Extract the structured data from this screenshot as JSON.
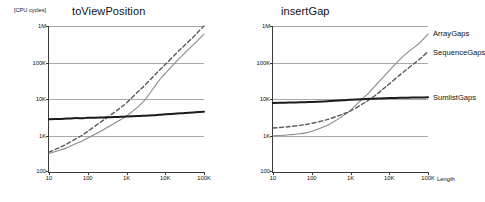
{
  "figure": {
    "unit_label": "[CPU cycles]",
    "xaxis_caption": "Length",
    "series_colors": {
      "ArrayGaps": "#8a8a8a",
      "SequenceGaps": "#5a5a5a",
      "SumlistGaps": "#1a1a1a"
    },
    "axis_color": "#3a3a3a",
    "grid_color": "#a8a8a8",
    "background": "#ffffff"
  },
  "legend": {
    "position": "right",
    "entries": [
      {
        "label": "ArrayGaps"
      },
      {
        "label": "SequenceGaps"
      },
      {
        "label": "SumlistGaps"
      }
    ]
  },
  "chart_data": [
    {
      "id": "toViewPosition",
      "type": "line",
      "title": "toViewPosition",
      "xlabel": "Length",
      "ylabel": "[CPU cycles]",
      "xscale": "log",
      "yscale": "log",
      "xlim": [
        10,
        100000
      ],
      "ylim": [
        100,
        1000000
      ],
      "grid": true,
      "xticks": [
        10,
        100,
        1000,
        10000,
        100000
      ],
      "xticklabels": [
        "10",
        "100",
        "1K",
        "10K",
        "100K"
      ],
      "yticks": [
        100,
        1000,
        10000,
        100000,
        1000000
      ],
      "yticklabels": [
        "100",
        "1K",
        "10K",
        "100K",
        "1M"
      ],
      "x": [
        10,
        20,
        30,
        50,
        70,
        100,
        200,
        300,
        500,
        700,
        1000,
        2000,
        3000,
        5000,
        7000,
        10000,
        20000,
        30000,
        50000,
        70000,
        100000
      ],
      "series": [
        {
          "name": "ArrayGaps",
          "style": "solid-thin",
          "values": [
            320,
            400,
            470,
            600,
            700,
            850,
            1250,
            1600,
            2200,
            2700,
            3400,
            6200,
            9500,
            20000,
            33000,
            50000,
            110000,
            170000,
            290000,
            410000,
            600000
          ]
        },
        {
          "name": "SequenceGaps",
          "style": "dashed",
          "values": [
            350,
            480,
            600,
            820,
            1000,
            1300,
            2200,
            3000,
            4400,
            5800,
            7800,
            16000,
            24000,
            42000,
            61000,
            88000,
            185000,
            280000,
            470000,
            680000,
            1000000
          ]
        },
        {
          "name": "SumlistGaps",
          "style": "solid-thick",
          "values": [
            2800,
            2850,
            2900,
            3000,
            2950,
            3050,
            3100,
            3150,
            3200,
            3250,
            3300,
            3400,
            3500,
            3600,
            3700,
            3800,
            4000,
            4100,
            4250,
            4400,
            4500
          ]
        }
      ]
    },
    {
      "id": "insertGap",
      "type": "line",
      "title": "insertGap",
      "xlabel": "Length",
      "ylabel": "[CPU cycles]",
      "xscale": "log",
      "yscale": "log",
      "xlim": [
        10,
        100000
      ],
      "ylim": [
        100,
        1000000
      ],
      "grid": true,
      "xticks": [
        10,
        100,
        1000,
        10000,
        100000
      ],
      "xticklabels": [
        "10",
        "100",
        "1K",
        "10K",
        "100K"
      ],
      "yticks": [
        100,
        1000,
        10000,
        100000,
        1000000
      ],
      "yticklabels": [
        "100",
        "1K",
        "10K",
        "100K",
        "1M"
      ],
      "x": [
        10,
        20,
        30,
        50,
        70,
        100,
        200,
        300,
        500,
        700,
        1000,
        2000,
        3000,
        5000,
        7000,
        10000,
        20000,
        30000,
        50000,
        70000,
        100000
      ],
      "series": [
        {
          "name": "ArrayGaps",
          "style": "solid-thin",
          "values": [
            980,
            1020,
            1060,
            1120,
            1180,
            1300,
            1700,
            2100,
            2900,
            3700,
            4900,
            10000,
            15000,
            27000,
            40000,
            60000,
            130000,
            190000,
            290000,
            400000,
            600000
          ]
        },
        {
          "name": "SequenceGaps",
          "style": "dashed",
          "values": [
            1600,
            1700,
            1780,
            1900,
            2000,
            2150,
            2550,
            2900,
            3500,
            4000,
            4700,
            7200,
            9500,
            14000,
            19000,
            26000,
            48000,
            68000,
            105000,
            140000,
            200000
          ]
        },
        {
          "name": "SumlistGaps",
          "style": "solid-thick",
          "values": [
            7800,
            7900,
            8000,
            8100,
            8200,
            8300,
            8600,
            8800,
            9100,
            9300,
            9500,
            9900,
            10100,
            10300,
            10450,
            10600,
            10800,
            10900,
            11000,
            11050,
            11100
          ]
        }
      ]
    }
  ]
}
